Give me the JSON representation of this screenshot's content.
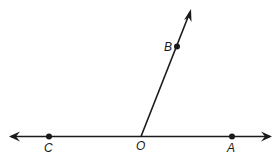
{
  "diagram": {
    "type": "geometry-angle",
    "points": [
      {
        "label": "C",
        "x": 49,
        "y": 136
      },
      {
        "label": "O",
        "x": 141,
        "y": 136
      },
      {
        "label": "A",
        "x": 232,
        "y": 136
      },
      {
        "label": "B",
        "x": 177,
        "y": 47
      }
    ],
    "labels": {
      "c": "C",
      "o": "O",
      "a": "A",
      "b": "B"
    },
    "line_color": "#1a1a1a"
  }
}
